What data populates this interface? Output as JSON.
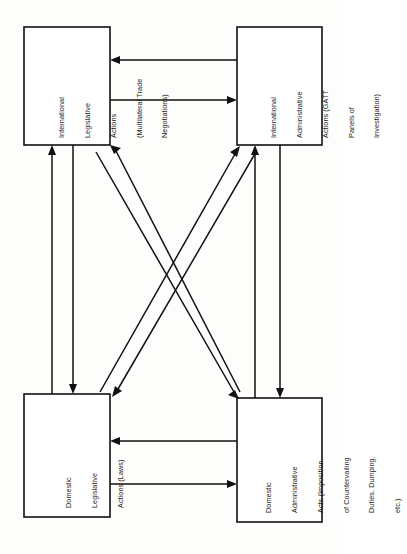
{
  "diagram": {
    "orientation": "rotated-90-ccw",
    "background_color": "#fdfdfc",
    "line_color": "#111111",
    "box_fill": "#ffffff",
    "nodes": [
      {
        "id": "international-legislative",
        "position": "top-left",
        "lines": [
          "International",
          "Legislative",
          "Actions",
          "(Multilateral Trade",
          "Negotiations)"
        ],
        "text": "International Legislative Actions (Multilateral Trade Negotiations)"
      },
      {
        "id": "international-administrative",
        "position": "top-right",
        "lines": [
          "International",
          "Administrative",
          "Actions (GATT",
          "Panels of",
          "Investigation)"
        ],
        "text": "International Administrative Actions (GATT Panels of Investigation)"
      },
      {
        "id": "domestic-legislative",
        "position": "bottom-left",
        "lines": [
          "Domestic",
          "Legislative",
          "Actions (Laws)"
        ],
        "text": "Domestic Legislative Actions (Laws)"
      },
      {
        "id": "domestic-administrative",
        "position": "bottom-right",
        "lines": [
          "Domestic",
          "Administrative",
          "Acts (Imposition",
          "of Countervailing",
          "Duties, Dumping,",
          "etc.)"
        ],
        "text": "Domestic Administrative Acts (Imposition of Countervailing Duties, Dumping, etc.)"
      }
    ],
    "edges": [
      {
        "id": "edge-intl-admin-to-intl-leg",
        "from": "international-administrative",
        "to": "international-legislative",
        "kind": "straight-horizontal"
      },
      {
        "id": "edge-intl-leg-to-intl-admin",
        "from": "international-legislative",
        "to": "international-administrative",
        "kind": "straight-horizontal"
      },
      {
        "id": "edge-dom-admin-to-dom-leg",
        "from": "domestic-administrative",
        "to": "domestic-legislative",
        "kind": "straight-horizontal"
      },
      {
        "id": "edge-dom-leg-to-dom-admin",
        "from": "domestic-legislative",
        "to": "domestic-administrative",
        "kind": "straight-horizontal"
      },
      {
        "id": "edge-dom-leg-to-intl-leg",
        "from": "domestic-legislative",
        "to": "international-legislative",
        "kind": "straight-vertical"
      },
      {
        "id": "edge-intl-leg-to-dom-leg",
        "from": "international-legislative",
        "to": "domestic-legislative",
        "kind": "straight-vertical"
      },
      {
        "id": "edge-dom-admin-to-intl-admin",
        "from": "domestic-administrative",
        "to": "international-administrative",
        "kind": "straight-vertical"
      },
      {
        "id": "edge-intl-admin-to-dom-admin",
        "from": "international-administrative",
        "to": "domestic-administrative",
        "kind": "straight-vertical"
      },
      {
        "id": "edge-dom-admin-to-intl-leg",
        "from": "domestic-administrative",
        "to": "international-legislative",
        "kind": "diagonal"
      },
      {
        "id": "edge-intl-leg-to-dom-admin",
        "from": "international-legislative",
        "to": "domestic-administrative",
        "kind": "diagonal"
      },
      {
        "id": "edge-dom-leg-to-intl-admin",
        "from": "domestic-legislative",
        "to": "international-administrative",
        "kind": "diagonal"
      },
      {
        "id": "edge-intl-admin-to-dom-leg",
        "from": "international-administrative",
        "to": "domestic-legislative",
        "kind": "diagonal"
      }
    ]
  }
}
